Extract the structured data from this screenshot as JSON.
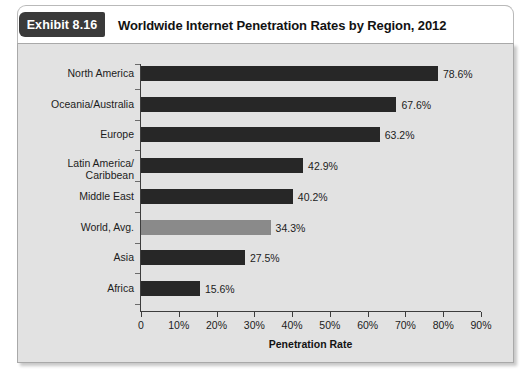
{
  "exhibit": {
    "badge_label": "Exhibit 8.16",
    "title": "Worldwide Internet Penetration Rates by Region, 2012"
  },
  "colors": {
    "bar_dark": "#272727",
    "bar_highlight": "#8a8a8a",
    "panel_background": "#e2e2e2",
    "badge_background": "#3a3a3a"
  },
  "chart_data": {
    "type": "bar",
    "orientation": "horizontal",
    "title": "Worldwide Internet Penetration Rates by Region, 2012",
    "xlabel": "Penetration Rate",
    "ylabel": "",
    "xlim": [
      0,
      90
    ],
    "grid": false,
    "legend": null,
    "categories": [
      "North America",
      "Oceania/Australia",
      "Europe",
      "Latin America/\nCaribbean",
      "Middle East",
      "World, Avg.",
      "Asia",
      "Africa"
    ],
    "category_lines": [
      [
        "North America"
      ],
      [
        "Oceania/Australia"
      ],
      [
        "Europe"
      ],
      [
        "Latin America/",
        "Caribbean"
      ],
      [
        "Middle East"
      ],
      [
        "World, Avg."
      ],
      [
        "Asia"
      ],
      [
        "Africa"
      ]
    ],
    "values": [
      78.6,
      67.6,
      63.2,
      42.9,
      40.2,
      34.3,
      27.5,
      15.6
    ],
    "value_labels": [
      "78.6%",
      "67.6%",
      "63.2%",
      "42.9%",
      "40.2%",
      "34.3%",
      "27.5%",
      "15.6%"
    ],
    "bar_colors": [
      "dark",
      "dark",
      "dark",
      "dark",
      "dark",
      "gray",
      "dark",
      "dark"
    ],
    "xticks": [
      0,
      10,
      20,
      30,
      40,
      50,
      60,
      70,
      80,
      90
    ],
    "xtick_labels": [
      "0",
      "10%",
      "20%",
      "30%",
      "40%",
      "50%",
      "60%",
      "70%",
      "80%",
      "90%"
    ]
  }
}
